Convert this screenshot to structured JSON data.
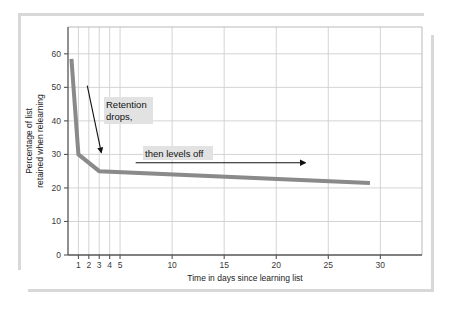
{
  "figure": {
    "frame_color": "#d8d8d8",
    "background": "#ffffff"
  },
  "chart_data": {
    "type": "line",
    "title": "",
    "subtitle": "",
    "xlabel": "Time in days since learning list",
    "ylabel": "Percentage of list retained when relearning",
    "ylabel_line1": "Percentage of list",
    "ylabel_line2": "retained when relearning",
    "xlim": [
      0,
      34
    ],
    "ylim": [
      0,
      68
    ],
    "x_ticks": [
      1,
      2,
      3,
      4,
      5,
      10,
      15,
      20,
      25,
      30
    ],
    "x_tick_labels": [
      "1",
      "2",
      "3",
      "4",
      "5",
      "10",
      "15",
      "20",
      "25",
      "30"
    ],
    "y_ticks": [
      0,
      10,
      20,
      30,
      40,
      50,
      60
    ],
    "y_tick_labels": [
      "0",
      "10",
      "20",
      "30",
      "40",
      "50",
      "60"
    ],
    "grid": true,
    "grid_x_values": [
      1,
      2,
      3,
      4,
      5,
      10,
      15,
      20,
      25,
      30
    ],
    "grid_y_values": [
      10,
      20,
      30,
      40,
      50,
      60
    ],
    "legend": "none",
    "series": [
      {
        "name": "Retention curve",
        "color": "#8a8a8a",
        "line_width": 4,
        "x": [
          0.33,
          0.33,
          1.0,
          3.0,
          29.0
        ],
        "y": [
          58.5,
          58.5,
          30.0,
          25.0,
          21.5
        ]
      }
    ],
    "points": [
      {
        "x": 0.33,
        "y": 58.5
      },
      {
        "x": 1.0,
        "y": 30.0
      },
      {
        "x": 3.0,
        "y": 25.0
      },
      {
        "x": 29.0,
        "y": 21.5
      }
    ],
    "annotations": [
      {
        "id": "retention-drops",
        "text_line1": "Retention",
        "text_line2": "drops,",
        "highlight_color": "#e2e2e2",
        "arrow": "diagonal-down-right",
        "arrow_from_x": 1.85,
        "arrow_from_y": 50.5,
        "arrow_to_x": 3.2,
        "arrow_to_y": 30.5
      },
      {
        "id": "then-levels-off",
        "text": "then levels off",
        "highlight_color": "#e2e2e2",
        "arrow": "horizontal-right",
        "arrow_from_x": 6.5,
        "arrow_from_y": 27.5,
        "arrow_to_x": 22.8,
        "arrow_to_y": 27.5
      }
    ]
  },
  "axes": {
    "x_axis_name": "Time in days since learning list",
    "y_axis_name": "Percentage of list retained when relearning"
  }
}
